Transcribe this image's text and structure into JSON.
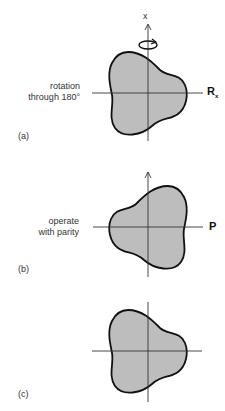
{
  "panels": [
    {
      "id": "a",
      "panel_label": "(a)",
      "operation_text_line1": "rotation",
      "operation_text_line2": "through 180°",
      "operator_label": "R",
      "operator_subscript": "x",
      "axis_label": "x",
      "has_rotation_arrow": true
    },
    {
      "id": "b",
      "panel_label": "(b)",
      "operation_text_line1": "operate",
      "operation_text_line2": "with parity",
      "operator_label": "P"
    },
    {
      "id": "c",
      "panel_label": "(c)"
    }
  ],
  "colors": {
    "shape_fill": "#bdbdbd",
    "shape_stroke": "#111111",
    "axis": "#333333"
  }
}
